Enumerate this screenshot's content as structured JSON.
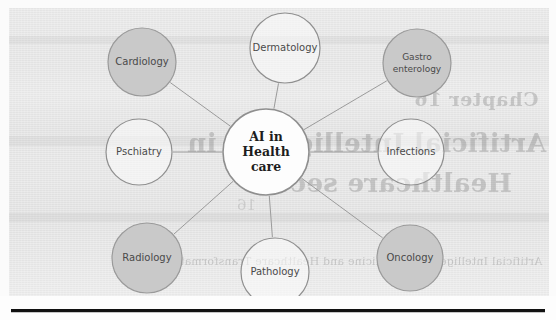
{
  "page": {
    "type": "scanned-book-page",
    "width": 556,
    "height": 320,
    "paper_color": "#e7e7e7",
    "rule_color": "#111111"
  },
  "bleed_through": {
    "chapter": "Chapter 16",
    "title_line1": "Artificial Intelligence in",
    "title_line2": "Healthcare sector",
    "caption": "Artificial Intelligence in Medicine and Healthcare Transformation",
    "small": "16"
  },
  "diagram": {
    "type": "hub-and-spoke",
    "center": {
      "id": "ai-in-healthcare",
      "lines": [
        "AI in",
        "Health",
        "care"
      ],
      "fill": "#fdfdfd",
      "stroke": "#8f8f8f",
      "cx": 266,
      "cy": 152,
      "r": 43
    },
    "nodes": [
      {
        "id": "cardiology",
        "lines": [
          "Cardiology"
        ],
        "filled": true,
        "fill": "#c9c9c9",
        "stroke": "#9a9a9a",
        "cx": 142,
        "cy": 62,
        "r": 34
      },
      {
        "id": "dermatology",
        "lines": [
          "Dermatology"
        ],
        "filled": false,
        "fill": "none",
        "stroke": "#8f8f8f",
        "cx": 285,
        "cy": 48,
        "r": 35
      },
      {
        "id": "gastroenterology",
        "lines": [
          "Gastro",
          "enterology"
        ],
        "filled": true,
        "fill": "#c9c9c9",
        "stroke": "#9a9a9a",
        "cx": 417,
        "cy": 63,
        "r": 34
      },
      {
        "id": "infections",
        "lines": [
          "Infections"
        ],
        "filled": false,
        "fill": "none",
        "stroke": "#8f8f8f",
        "cx": 411,
        "cy": 152,
        "r": 33
      },
      {
        "id": "oncology",
        "lines": [
          "Oncology"
        ],
        "filled": true,
        "fill": "#c9c9c9",
        "stroke": "#9a9a9a",
        "cx": 410,
        "cy": 258,
        "r": 33
      },
      {
        "id": "pathology",
        "lines": [
          "Pathology"
        ],
        "filled": false,
        "fill": "none",
        "stroke": "#8f8f8f",
        "cx": 275,
        "cy": 272,
        "r": 34
      },
      {
        "id": "radiology",
        "lines": [
          "Radiology"
        ],
        "filled": true,
        "fill": "#c9c9c9",
        "stroke": "#9a9a9a",
        "cx": 147,
        "cy": 258,
        "r": 35
      },
      {
        "id": "pschiatry",
        "lines": [
          "Pschiatry"
        ],
        "filled": false,
        "fill": "none",
        "stroke": "#8f8f8f",
        "cx": 139,
        "cy": 152,
        "r": 33
      }
    ],
    "edges": [
      {
        "from": "ai-in-healthcare",
        "to": "cardiology"
      },
      {
        "from": "ai-in-healthcare",
        "to": "dermatology"
      },
      {
        "from": "ai-in-healthcare",
        "to": "gastroenterology"
      },
      {
        "from": "ai-in-healthcare",
        "to": "infections"
      },
      {
        "from": "ai-in-healthcare",
        "to": "oncology"
      },
      {
        "from": "ai-in-healthcare",
        "to": "pathology"
      },
      {
        "from": "ai-in-healthcare",
        "to": "radiology"
      },
      {
        "from": "ai-in-healthcare",
        "to": "pschiatry"
      }
    ],
    "edge_color": "#9b9b9b"
  }
}
